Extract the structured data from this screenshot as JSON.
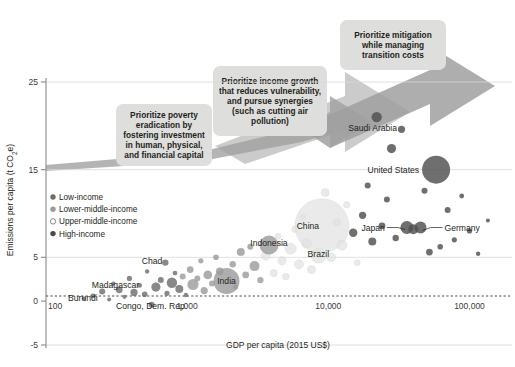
{
  "chart_data": {
    "type": "scatter",
    "title": "",
    "xlabel": "GDP per capita (2015 US$)",
    "ylabel": "Emissions per capita (t CO₂e)",
    "xscale": "log",
    "xlim": [
      100,
      200000
    ],
    "ylim": [
      -5,
      25
    ],
    "xticks": [
      "100",
      "1,000",
      "10,000",
      "100,000"
    ],
    "xtick_values": [
      100,
      1000,
      10000,
      100000
    ],
    "yticks": [
      "-5",
      "0",
      "5",
      "15",
      "25"
    ],
    "ytick_values": [
      -5,
      0,
      5,
      15,
      25
    ],
    "grid": "horizontal",
    "zero_line": true,
    "legend_position": "left-inside",
    "legend": [
      {
        "label": "Low-income",
        "fill": "#6e6e6e",
        "open": false
      },
      {
        "label": "Lower-middle-income",
        "fill": "#9a9a9a",
        "open": false
      },
      {
        "label": "Upper-middle-income",
        "fill": "#ffffff",
        "open": true
      },
      {
        "label": "High-income",
        "fill": "#4a4a4a",
        "open": false
      }
    ],
    "annotations": [
      {
        "text": "Prioritize poverty eradication by fostering investment in human, physical, and financial capital",
        "lines": [
          "Prioritize poverty",
          "eradication by",
          "fostering investment",
          "in human, physical,",
          "and financial capital"
        ]
      },
      {
        "text": "Prioritize income growth that reduces vulnerability, and pursue synergies (such as cutting air pollution)",
        "lines": [
          "Prioritize income growth",
          "that reduces vulnerability,",
          "and pursue synergies",
          "(such as cutting air",
          "pollution)"
        ]
      },
      {
        "text": "Prioritize mitigation while managing transition costs",
        "lines": [
          "Prioritize mitigation",
          "while managing",
          "transition costs"
        ]
      }
    ],
    "labeled_points": [
      {
        "name": "Burundi",
        "x": 240,
        "y": 0.4,
        "label_dx": -2,
        "label_dy": 0,
        "anchor": "end"
      },
      {
        "name": "Congo, Dem. Rep.",
        "x": 560,
        "y": -0.6,
        "label_dx": 0,
        "label_dy": 0,
        "anchor": "middle"
      },
      {
        "name": "Madagascar",
        "x": 480,
        "y": 1.9,
        "label_dx": -3,
        "label_dy": 0,
        "anchor": "end"
      },
      {
        "name": "Chad",
        "x": 700,
        "y": 4.6,
        "label_dx": -3,
        "label_dy": 0,
        "anchor": "end"
      },
      {
        "name": "India",
        "x": 1900,
        "y": 2.3,
        "label_dx": 0,
        "label_dy": 0,
        "anchor": "middle"
      },
      {
        "name": "Indonesia",
        "x": 3800,
        "y": 6.6,
        "label_dx": 0,
        "label_dy": 0,
        "anchor": "middle"
      },
      {
        "name": "Brazil",
        "x": 8500,
        "y": 5.4,
        "label_dx": 0,
        "label_dy": 0,
        "anchor": "middle"
      },
      {
        "name": "China",
        "x": 9000,
        "y": 8.6,
        "label_dx": 0,
        "label_dy": 0,
        "anchor": "middle"
      },
      {
        "name": "Japan",
        "x": 36000,
        "y": 8.4,
        "label_dx": 0,
        "label_dy": 0,
        "anchor": "middle"
      },
      {
        "name": "Germany",
        "x": 45000,
        "y": 8.4,
        "label_dx": 0,
        "label_dy": 0,
        "anchor": "middle"
      },
      {
        "name": "United States",
        "x": 58000,
        "y": 15.0,
        "label_dx": 0,
        "label_dy": 0,
        "anchor": "end"
      },
      {
        "name": "Saudi Arabia",
        "x": 22000,
        "y": 21.0,
        "label_dx": 0,
        "label_dy": 0,
        "anchor": "middle"
      }
    ],
    "bubbles": [
      {
        "x": 185,
        "y": 0.3,
        "r": 2.0,
        "g": "low"
      },
      {
        "x": 215,
        "y": 0.6,
        "r": 2.4,
        "g": "low"
      },
      {
        "x": 250,
        "y": 1.1,
        "r": 3.0,
        "g": "low"
      },
      {
        "x": 280,
        "y": 0.2,
        "r": 2.0,
        "g": "low"
      },
      {
        "x": 300,
        "y": 2.0,
        "r": 2.2,
        "g": "low"
      },
      {
        "x": 330,
        "y": 1.3,
        "r": 3.4,
        "g": "low"
      },
      {
        "x": 360,
        "y": 0.5,
        "r": 2.1,
        "g": "low"
      },
      {
        "x": 390,
        "y": 2.6,
        "r": 2.6,
        "g": "low"
      },
      {
        "x": 420,
        "y": 1.0,
        "r": 3.6,
        "g": "low"
      },
      {
        "x": 460,
        "y": 1.8,
        "r": 2.4,
        "g": "low"
      },
      {
        "x": 500,
        "y": 0.8,
        "r": 2.8,
        "g": "low"
      },
      {
        "x": 520,
        "y": 3.4,
        "r": 2.2,
        "g": "low"
      },
      {
        "x": 560,
        "y": -0.4,
        "r": 3.0,
        "g": "low"
      },
      {
        "x": 600,
        "y": 1.6,
        "r": 4.6,
        "g": "low"
      },
      {
        "x": 650,
        "y": 2.4,
        "r": 3.0,
        "g": "low"
      },
      {
        "x": 700,
        "y": 4.4,
        "r": 3.2,
        "g": "low"
      },
      {
        "x": 720,
        "y": 0.9,
        "r": 2.6,
        "g": "low"
      },
      {
        "x": 780,
        "y": 2.1,
        "r": 5.2,
        "g": "low"
      },
      {
        "x": 820,
        "y": 3.2,
        "r": 2.4,
        "g": "low"
      },
      {
        "x": 880,
        "y": 1.4,
        "r": 4.0,
        "g": "low"
      },
      {
        "x": 930,
        "y": 2.8,
        "r": 3.0,
        "g": "lowmid"
      },
      {
        "x": 980,
        "y": 0.7,
        "r": 2.2,
        "g": "low"
      },
      {
        "x": 1050,
        "y": 3.6,
        "r": 3.4,
        "g": "lowmid"
      },
      {
        "x": 1100,
        "y": 1.9,
        "r": 5.6,
        "g": "lowmid"
      },
      {
        "x": 1180,
        "y": 2.6,
        "r": 3.0,
        "g": "lowmid"
      },
      {
        "x": 1250,
        "y": 4.6,
        "r": 2.6,
        "g": "lowmid"
      },
      {
        "x": 1320,
        "y": 1.2,
        "r": 3.6,
        "g": "lowmid"
      },
      {
        "x": 1400,
        "y": 3.0,
        "r": 4.4,
        "g": "lowmid"
      },
      {
        "x": 1500,
        "y": 2.0,
        "r": 3.0,
        "g": "lowmid"
      },
      {
        "x": 1600,
        "y": 5.0,
        "r": 2.8,
        "g": "lowmid"
      },
      {
        "x": 1700,
        "y": 3.4,
        "r": 3.8,
        "g": "lowmid"
      },
      {
        "x": 1900,
        "y": 2.3,
        "r": 13.0,
        "g": "lowmid"
      },
      {
        "x": 2100,
        "y": 4.2,
        "r": 3.2,
        "g": "lowmid"
      },
      {
        "x": 2200,
        "y": 1.6,
        "r": 2.6,
        "g": "lowmid"
      },
      {
        "x": 2400,
        "y": 5.6,
        "r": 4.0,
        "g": "lowmid"
      },
      {
        "x": 2600,
        "y": 3.0,
        "r": 3.4,
        "g": "lowmid"
      },
      {
        "x": 2800,
        "y": 6.2,
        "r": 3.0,
        "g": "lowmid"
      },
      {
        "x": 3000,
        "y": 4.0,
        "r": 5.0,
        "g": "lowmid"
      },
      {
        "x": 3300,
        "y": 2.4,
        "r": 3.2,
        "g": "lowmid"
      },
      {
        "x": 3600,
        "y": 5.2,
        "r": 4.4,
        "g": "upmid"
      },
      {
        "x": 3800,
        "y": 6.4,
        "r": 9.5,
        "g": "lowmid"
      },
      {
        "x": 4100,
        "y": 3.2,
        "r": 3.6,
        "g": "upmid"
      },
      {
        "x": 4400,
        "y": 7.4,
        "r": 3.0,
        "g": "upmid"
      },
      {
        "x": 4700,
        "y": 4.6,
        "r": 4.2,
        "g": "upmid"
      },
      {
        "x": 5000,
        "y": 2.8,
        "r": 3.4,
        "g": "upmid"
      },
      {
        "x": 5400,
        "y": 6.0,
        "r": 5.6,
        "g": "upmid"
      },
      {
        "x": 5800,
        "y": 8.2,
        "r": 3.2,
        "g": "upmid"
      },
      {
        "x": 6200,
        "y": 4.2,
        "r": 4.6,
        "g": "upmid"
      },
      {
        "x": 6600,
        "y": 9.6,
        "r": 3.0,
        "g": "upmid"
      },
      {
        "x": 7000,
        "y": 6.6,
        "r": 5.0,
        "g": "upmid"
      },
      {
        "x": 7600,
        "y": 3.6,
        "r": 4.0,
        "g": "upmid"
      },
      {
        "x": 8500,
        "y": 5.2,
        "r": 7.5,
        "g": "upmid"
      },
      {
        "x": 9000,
        "y": 8.6,
        "r": 27.0,
        "g": "upmid"
      },
      {
        "x": 9500,
        "y": 12.4,
        "r": 4.0,
        "g": "upmid"
      },
      {
        "x": 10500,
        "y": 5.0,
        "r": 4.4,
        "g": "upmid"
      },
      {
        "x": 11500,
        "y": 9.0,
        "r": 3.4,
        "g": "upmid"
      },
      {
        "x": 12500,
        "y": 6.4,
        "r": 5.0,
        "g": "upmid"
      },
      {
        "x": 13500,
        "y": 11.0,
        "r": 3.2,
        "g": "upmid"
      },
      {
        "x": 15000,
        "y": 7.8,
        "r": 4.2,
        "g": "high"
      },
      {
        "x": 16000,
        "y": 4.4,
        "r": 3.0,
        "g": "upmid"
      },
      {
        "x": 17500,
        "y": 9.8,
        "r": 3.6,
        "g": "high"
      },
      {
        "x": 19000,
        "y": 13.2,
        "r": 3.0,
        "g": "high"
      },
      {
        "x": 20500,
        "y": 6.8,
        "r": 4.0,
        "g": "high"
      },
      {
        "x": 22000,
        "y": 21.0,
        "r": 5.2,
        "g": "high"
      },
      {
        "x": 24000,
        "y": 8.6,
        "r": 3.4,
        "g": "high"
      },
      {
        "x": 26000,
        "y": 11.6,
        "r": 3.0,
        "g": "high"
      },
      {
        "x": 28000,
        "y": 17.4,
        "r": 4.6,
        "g": "high"
      },
      {
        "x": 30000,
        "y": 7.2,
        "r": 3.2,
        "g": "high"
      },
      {
        "x": 33000,
        "y": 19.6,
        "r": 3.6,
        "g": "high"
      },
      {
        "x": 36000,
        "y": 8.4,
        "r": 6.5,
        "g": "high"
      },
      {
        "x": 40000,
        "y": 8.2,
        "r": 5.0,
        "g": "high"
      },
      {
        "x": 45000,
        "y": 8.4,
        "r": 6.0,
        "g": "high"
      },
      {
        "x": 48000,
        "y": 12.6,
        "r": 3.0,
        "g": "high"
      },
      {
        "x": 52000,
        "y": 5.6,
        "r": 3.4,
        "g": "high"
      },
      {
        "x": 58000,
        "y": 15.0,
        "r": 14.0,
        "g": "high"
      },
      {
        "x": 62000,
        "y": 6.2,
        "r": 2.8,
        "g": "high"
      },
      {
        "x": 70000,
        "y": 10.4,
        "r": 3.0,
        "g": "high"
      },
      {
        "x": 78000,
        "y": 7.0,
        "r": 2.6,
        "g": "high"
      },
      {
        "x": 88000,
        "y": 12.0,
        "r": 2.4,
        "g": "high"
      },
      {
        "x": 100000,
        "y": 8.0,
        "r": 2.6,
        "g": "high"
      },
      {
        "x": 115000,
        "y": 5.4,
        "r": 2.2,
        "g": "high"
      },
      {
        "x": 135000,
        "y": 9.2,
        "r": 2.0,
        "g": "high"
      }
    ],
    "group_colors": {
      "low": "#6e6e6e",
      "lowmid": "#9c9c9c",
      "upmid": "#e3e3e3",
      "high": "#4f4f4f"
    }
  }
}
